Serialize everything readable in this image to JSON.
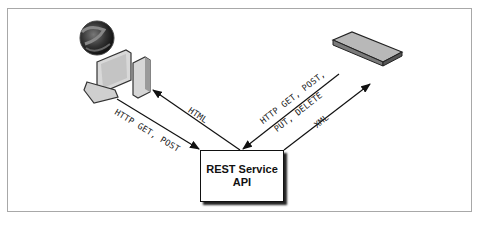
{
  "diagram": {
    "nodes": {
      "client": {
        "icon": "browser-computer-icon"
      },
      "device": {
        "icon": "network-device-icon"
      },
      "api": {
        "line1": "REST Service",
        "line2": "API"
      }
    },
    "edges": {
      "client_to_api": "HTTP GET, POST",
      "api_to_client": "HTML",
      "device_to_api_line1": "HTTP GET, POST,",
      "device_to_api_line2": "PUT, DELETE",
      "api_to_device": "XML"
    }
  }
}
